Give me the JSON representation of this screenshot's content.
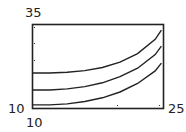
{
  "chart_data": {
    "type": "line",
    "title": "",
    "xlabel": "",
    "ylabel": "",
    "xlim": [
      10,
      25
    ],
    "ylim": [
      10,
      35
    ],
    "tick_labels": {
      "ymax": "35",
      "ymin": "10",
      "xmin": "10",
      "xmax": "25"
    },
    "grid": false,
    "legend": null,
    "series": [
      {
        "name": "curve 1",
        "x": [
          10,
          12,
          14,
          16,
          18,
          20,
          22,
          24,
          24.7
        ],
        "y": [
          20.6,
          20.6,
          20.8,
          21.3,
          22.2,
          23.8,
          26.3,
          30.5,
          33.2
        ]
      },
      {
        "name": "curve 2",
        "x": [
          10,
          12,
          14,
          16,
          18,
          20,
          22,
          24,
          24.7
        ],
        "y": [
          15.6,
          15.6,
          15.9,
          16.6,
          17.7,
          19.5,
          22.0,
          26.0,
          28.5
        ]
      },
      {
        "name": "curve 3",
        "x": [
          10,
          12,
          14,
          16,
          18,
          20,
          22,
          24,
          24.7
        ],
        "y": [
          11.2,
          11.2,
          11.5,
          12.2,
          13.3,
          15.0,
          17.5,
          21.2,
          23.5
        ]
      }
    ]
  },
  "axes": {
    "ymax": "35",
    "ymin": "10",
    "xmin": "10",
    "xmax": "25"
  }
}
